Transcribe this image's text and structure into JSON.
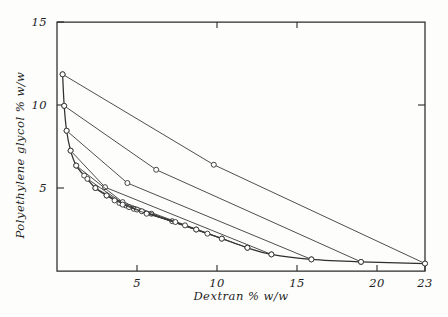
{
  "chart_data": {
    "type": "line",
    "title": "",
    "xlabel": "Dextran  % w/w",
    "ylabel": "Polyethylene glycol   % w/w",
    "xlim": [
      0,
      23
    ],
    "ylim": [
      0,
      15
    ],
    "grid": false,
    "legend": "none",
    "xticks": [
      {
        "value": 5,
        "label": "5"
      },
      {
        "value": 10,
        "label": "10"
      },
      {
        "value": 15,
        "label": "15"
      },
      {
        "value": 20,
        "label": "20"
      },
      {
        "value": 23,
        "label": "23"
      }
    ],
    "yticks": [
      {
        "value": 5,
        "label": "5"
      },
      {
        "value": 10,
        "label": "10"
      },
      {
        "value": 15,
        "label": "15"
      }
    ],
    "series": [
      {
        "name": "binodal",
        "style": "curve",
        "markers": true,
        "points": [
          {
            "x": 0.35,
            "y": 11.85
          },
          {
            "x": 0.45,
            "y": 9.95
          },
          {
            "x": 0.6,
            "y": 8.45
          },
          {
            "x": 0.85,
            "y": 7.25
          },
          {
            "x": 1.2,
            "y": 6.35
          },
          {
            "x": 1.7,
            "y": 5.75
          },
          {
            "x": 2.4,
            "y": 5.0
          },
          {
            "x": 3.1,
            "y": 4.55
          },
          {
            "x": 3.9,
            "y": 4.1
          },
          {
            "x": 4.8,
            "y": 3.75
          },
          {
            "x": 5.9,
            "y": 3.45
          },
          {
            "x": 7.2,
            "y": 3.0
          },
          {
            "x": 8.7,
            "y": 2.5
          },
          {
            "x": 10.3,
            "y": 1.95
          },
          {
            "x": 11.9,
            "y": 1.4
          },
          {
            "x": 13.4,
            "y": 1.0
          },
          {
            "x": 15.9,
            "y": 0.7
          },
          {
            "x": 19.0,
            "y": 0.55
          },
          {
            "x": 23.0,
            "y": 0.45
          }
        ]
      },
      {
        "name": "tie-line-1",
        "style": "straight",
        "markers": true,
        "points": [
          {
            "x": 0.35,
            "y": 11.85
          },
          {
            "x": 9.8,
            "y": 6.4
          },
          {
            "x": 23.0,
            "y": 0.45
          }
        ]
      },
      {
        "name": "tie-line-2",
        "style": "straight",
        "markers": true,
        "points": [
          {
            "x": 0.45,
            "y": 9.95
          },
          {
            "x": 6.2,
            "y": 6.1
          },
          {
            "x": 19.0,
            "y": 0.55
          }
        ]
      },
      {
        "name": "tie-line-3",
        "style": "straight",
        "markers": true,
        "points": [
          {
            "x": 0.6,
            "y": 8.45
          },
          {
            "x": 4.4,
            "y": 5.3
          },
          {
            "x": 15.9,
            "y": 0.7
          }
        ]
      },
      {
        "name": "tie-line-4",
        "style": "straight",
        "markers": true,
        "points": [
          {
            "x": 0.85,
            "y": 7.25
          },
          {
            "x": 3.0,
            "y": 5.05
          },
          {
            "x": 13.4,
            "y": 1.0
          }
        ]
      },
      {
        "name": "tie-line-5",
        "style": "straight",
        "markers": true,
        "points": [
          {
            "x": 1.2,
            "y": 6.35
          },
          {
            "x": 4.1,
            "y": 4.15
          },
          {
            "x": 11.9,
            "y": 1.4
          }
        ]
      },
      {
        "name": "tie-line-6",
        "style": "straight",
        "markers": true,
        "points": [
          {
            "x": 1.9,
            "y": 5.55
          },
          {
            "x": 4.3,
            "y": 3.95
          },
          {
            "x": 10.3,
            "y": 1.95
          }
        ]
      },
      {
        "name": "tie-line-7",
        "style": "straight",
        "markers": true,
        "points": [
          {
            "x": 2.4,
            "y": 5.0
          },
          {
            "x": 4.5,
            "y": 3.85
          },
          {
            "x": 9.4,
            "y": 2.25
          }
        ]
      },
      {
        "name": "tie-line-8",
        "style": "straight",
        "markers": true,
        "points": [
          {
            "x": 3.1,
            "y": 4.55
          },
          {
            "x": 5.0,
            "y": 3.7
          },
          {
            "x": 8.7,
            "y": 2.5
          }
        ]
      },
      {
        "name": "tie-line-9",
        "style": "straight",
        "markers": true,
        "points": [
          {
            "x": 3.6,
            "y": 4.25
          },
          {
            "x": 5.3,
            "y": 3.6
          },
          {
            "x": 8.0,
            "y": 2.75
          }
        ]
      },
      {
        "name": "tie-line-10",
        "style": "straight",
        "markers": true,
        "points": [
          {
            "x": 4.1,
            "y": 4.0
          },
          {
            "x": 5.6,
            "y": 3.45
          },
          {
            "x": 7.4,
            "y": 2.95
          }
        ]
      }
    ]
  },
  "axes": {
    "x_title": "Dextran  % w/w",
    "y_title": "Polyethylene glycol   % w/w"
  }
}
